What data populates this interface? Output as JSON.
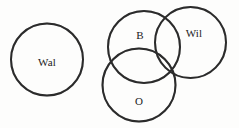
{
  "figure": {
    "type": "venn",
    "title": "",
    "background_color": "#fdfdfc",
    "stroke_color": "#2b2b2b",
    "shadow_color": "#b9b9b9",
    "label_color": "#1b1b1b",
    "width": 239,
    "height": 128
  },
  "chart_data": {
    "type": "diagram",
    "subtype": "venn",
    "title": "",
    "xlabel": "",
    "ylabel": "",
    "grid": false,
    "legend": "none",
    "sets": [
      {
        "id": "wal",
        "label": "Wal",
        "cx": 47,
        "cy": 59.5,
        "r": 36,
        "label_x": 47,
        "label_y": 62,
        "overlaps": []
      },
      {
        "id": "b",
        "label": "B",
        "cx": 144,
        "cy": 47,
        "r": 36,
        "label_x": 140,
        "label_y": 35,
        "overlaps": [
          "wil",
          "o"
        ]
      },
      {
        "id": "wil",
        "label": "Wil",
        "cx": 190.5,
        "cy": 42.5,
        "r": 35.5,
        "label_x": 194,
        "label_y": 33,
        "overlaps": [
          "b",
          "o"
        ]
      },
      {
        "id": "o",
        "label": "O",
        "cx": 139,
        "cy": 85,
        "r": 36.5,
        "label_x": 139,
        "label_y": 101,
        "overlaps": [
          "b",
          "wil"
        ]
      }
    ]
  }
}
